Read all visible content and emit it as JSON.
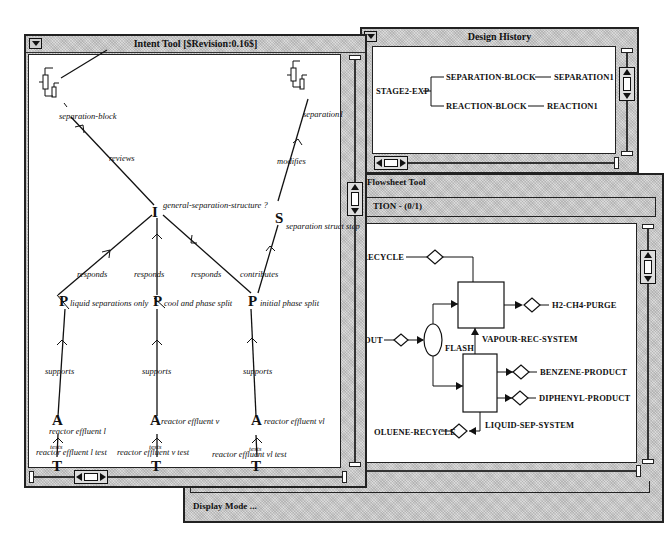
{
  "design_history": {
    "title": "Design History",
    "tree": {
      "root": "STAGE2-EXP",
      "branches": [
        {
          "label": "SEPARATION-BLOCK",
          "child": "SEPARATION1"
        },
        {
          "label": "REACTION-BLOCK",
          "child": "REACTION1"
        }
      ]
    }
  },
  "flowsheet_tool": {
    "title": "Flowsheet Tool",
    "header": "TION - (0/1)",
    "status_bar": "Display Mode ...",
    "streams": {
      "gas_recycle": "GAS-RECYCLE",
      "h2_ch4_purge": "H2-CH4-PURGE",
      "reactor_out": "-OUT",
      "benzene_product": "BENZENE-PRODUCT",
      "diphenyl_product": "DIPHENYL-PRODUCT",
      "toluene_recycle": "OLUENE-RECYCLE"
    },
    "units": {
      "flash": "FLASH",
      "vapour_rec_system": "VAPOUR-REC-SYSTEM",
      "liquid_sep_system": "LIQUID-SEP-SYSTEM"
    }
  },
  "intent_tool": {
    "title": "Intent Tool  [$Revision:0.16$]",
    "nodes": {
      "separation_block": "separation-block",
      "separation1": "separation1",
      "issue": {
        "symbol": "I",
        "label": "general-separation-structure ?"
      },
      "step": {
        "symbol": "S",
        "label": "separation struct step"
      },
      "positions": [
        {
          "symbol": "P",
          "label": "liquid separations only"
        },
        {
          "symbol": "P",
          "label": "cool and phase split"
        },
        {
          "symbol": "P",
          "label": "initial phase split"
        }
      ],
      "arguments": [
        {
          "symbol": "A",
          "label": "reactor effluent l"
        },
        {
          "symbol": "A",
          "label": "reactor effluent v"
        },
        {
          "symbol": "A",
          "label": "reactor effluent vl"
        }
      ],
      "tests": [
        {
          "symbol": "T",
          "label": "reactor effluent l test"
        },
        {
          "symbol": "T",
          "label": "reactor effluent v test"
        },
        {
          "symbol": "T",
          "label": "reactor effluent vl test"
        }
      ]
    },
    "edges": {
      "reviews": "reviews",
      "modifies": "modifies",
      "responds": "responds",
      "contributes": "contributes",
      "supports": "supports",
      "tests": "tests"
    }
  }
}
